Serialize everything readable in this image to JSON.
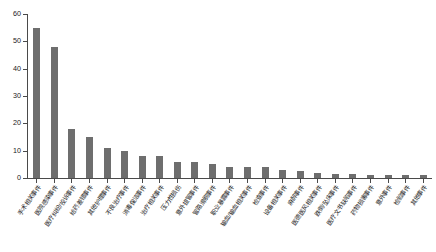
{
  "chart_data": {
    "type": "bar",
    "title": "",
    "subtitle": "",
    "xlabel": "",
    "ylabel": "",
    "ylim": [
      0,
      60
    ],
    "yticks": [
      0,
      10,
      20,
      30,
      40,
      50,
      60
    ],
    "grid": false,
    "legend": null,
    "bar_color": "#6e6e6e",
    "axis_color": "#4a4a4a",
    "background": "#ffffff",
    "categories": [
      "手术相关事件",
      "医院感染事件",
      "医疗纠纷/投诉事件",
      "给药差错事件",
      "其他护理事件",
      "不良治疗事件",
      "消毒保洁事件",
      "治疗相关事件",
      "压力性损伤",
      "意外拔管事件",
      "管路滑脱事件",
      "职业暴露事件",
      "输血/输血相关事件",
      "检查事件",
      "设备相关事件",
      "麻醉事件",
      "医德医风相关事件",
      "跌倒/坠床事件",
      "医疗文书缺陷事件",
      "药物损害事件",
      "意外事件",
      "检验事件",
      "其他事件"
    ],
    "values": [
      55,
      48,
      18,
      15,
      11,
      10,
      8,
      8,
      6,
      6,
      5,
      4,
      4,
      4,
      3,
      2.5,
      2,
      1.5,
      1.5,
      1.2,
      1,
      1,
      1
    ]
  },
  "axis": {
    "y_tick_labels": [
      "0",
      "10",
      "20",
      "30",
      "40",
      "50",
      "60"
    ]
  }
}
